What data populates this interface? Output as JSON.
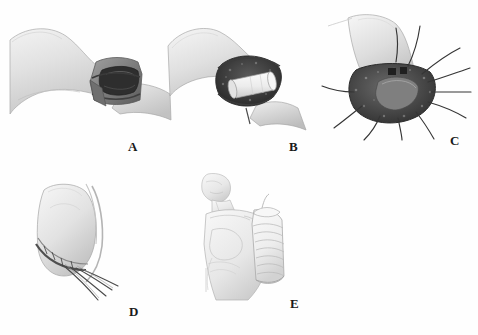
{
  "figure": {
    "background_color": "#fefefe",
    "width": 478,
    "height": 335,
    "panel_count": 5
  },
  "palette": {
    "skin_light": "#e9e9e9",
    "skin_mid": "#d4d4d4",
    "skin_shadow": "#b8b8b8",
    "tissue_dark": "#4a4a4a",
    "tissue_mid": "#6e6e6e",
    "cavity_black": "#2b2b2b",
    "implant_white": "#f4f4f4",
    "suture_line": "#3a3a3a",
    "outline": "#8a8a8a",
    "label_color": "#1a1a1a"
  },
  "panels": [
    {
      "id": "A",
      "label": "A",
      "caption": "Limb with incised cuff exposing defect",
      "label_x": 128,
      "label_y": 140,
      "art_x": 8,
      "art_y": 22,
      "art_w": 165,
      "art_h": 115
    },
    {
      "id": "B",
      "label": "B",
      "caption": "Cylindrical graft implant seated in cavity",
      "label_x": 289,
      "label_y": 140,
      "art_x": 160,
      "art_y": 20,
      "art_w": 150,
      "art_h": 120
    },
    {
      "id": "C",
      "label": "C",
      "caption": "Circumferential sutures placed around graft",
      "label_x": 450,
      "label_y": 138,
      "art_x": 318,
      "art_y": 12,
      "art_w": 150,
      "art_h": 125
    },
    {
      "id": "D",
      "label": "D",
      "caption": "Closed flap with trailing suture tails",
      "label_x": 129,
      "label_y": 305,
      "art_x": 28,
      "art_y": 182,
      "art_w": 130,
      "art_h": 120
    },
    {
      "id": "E",
      "label": "E",
      "caption": "Patient torso with bandaged arm dressing",
      "label_x": 290,
      "label_y": 305,
      "art_x": 186,
      "art_y": 172,
      "art_w": 120,
      "art_h": 130
    }
  ]
}
